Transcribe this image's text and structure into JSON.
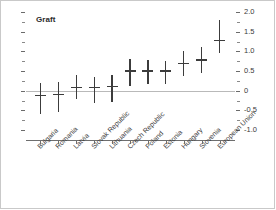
{
  "chart_data": {
    "type": "scatter",
    "title": "Graft",
    "xlabel": "",
    "ylabel": "",
    "ylim": [
      -1.25,
      2.0
    ],
    "yticks": [
      "2.0",
      "1.5",
      "1.0",
      "0.5",
      "0",
      "-0.5",
      "-1.0"
    ],
    "ytick_values": [
      2.0,
      1.5,
      1.0,
      0.5,
      0,
      -0.5,
      -1.0
    ],
    "minor_ticks": true,
    "grid": false,
    "legend": "none",
    "zero_reference_line": 0,
    "y_axis_position": "right",
    "categories": [
      "Bulgaria",
      "Romania",
      "Latvia",
      "Slovak Republic",
      "Lithuania",
      "Czech Republic",
      "Poland",
      "Estonia",
      "Hungary",
      "Slovenia",
      "European Union"
    ],
    "series": [
      {
        "name": "Graft",
        "values": [
          -0.1,
          -0.07,
          0.1,
          0.1,
          0.12,
          0.52,
          0.52,
          0.52,
          0.7,
          0.8,
          1.3
        ],
        "err_low": [
          -0.6,
          -0.55,
          -0.2,
          -0.3,
          -0.28,
          0.12,
          0.18,
          0.18,
          0.38,
          0.45,
          0.95
        ],
        "err_high": [
          0.2,
          0.22,
          0.4,
          0.35,
          0.4,
          0.8,
          0.78,
          0.75,
          1.0,
          1.1,
          1.8
        ]
      }
    ],
    "colors": {
      "marker": "#3c3c3c",
      "zero_line": "#b9b9b9",
      "axis": "#6e6e6e",
      "text": "#3a3a3a",
      "title": "#2b2b2b"
    }
  }
}
